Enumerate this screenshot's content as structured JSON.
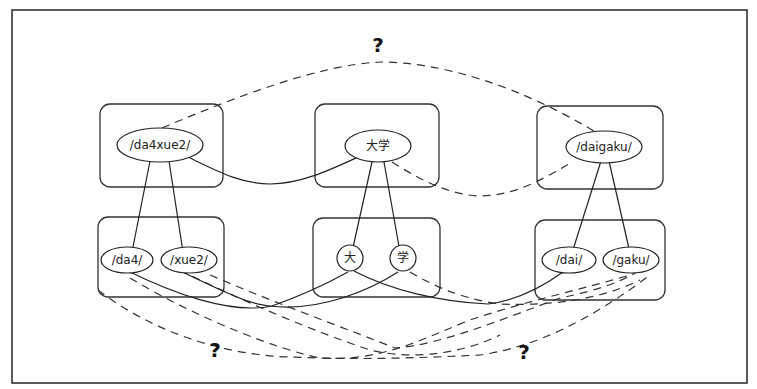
{
  "diagram": {
    "colors": {
      "stroke": "#333333",
      "background": "#ffffff",
      "text": "#222222"
    },
    "groups": [
      {
        "id": "pinyin-word",
        "label": "/da4xue2/"
      },
      {
        "id": "hanzi-word",
        "label": "大学"
      },
      {
        "id": "japanese-word",
        "label": "/daigaku/"
      }
    ],
    "nodes": {
      "pinyin_word": "/da4xue2/",
      "pinyin_syllable_1": "/da4/",
      "pinyin_syllable_2": "/xue2/",
      "hanzi_word": "大学",
      "hanzi_char_1": "大",
      "hanzi_char_2": "学",
      "japanese_word": "/daigaku/",
      "japanese_syllable_1": "/dai/",
      "japanese_syllable_2": "/gaku/"
    },
    "question_marks": {
      "top": "?",
      "bottom_left": "?",
      "bottom_right": "?"
    },
    "edges": {
      "solid": [
        "/da4xue2/ → /da4/",
        "/da4xue2/ → /xue2/",
        "/da4xue2/ → 大学",
        "大学 → 大",
        "大学 → 学",
        "/daigaku/ → /dai/",
        "/daigaku/ → /gaku/",
        "/da4/ → 大",
        "/xue2/ → 学",
        "大 → /dai/"
      ],
      "dashed": [
        "/da4xue2/ ⇢ /daigaku/ (top arc, ?)",
        "大学 ⇢ /daigaku/",
        "/da4/ ⇢ /gaku/",
        "/xue2/ ⇢ /dai/",
        "/da4/ ⇢ /dai/ (lower arc, ?)",
        "/xue2/ ⇢ /gaku/ (lower arc, ?)",
        "学 ⇢ /gaku/"
      ]
    }
  }
}
